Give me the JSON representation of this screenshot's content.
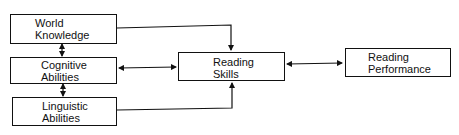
{
  "diagram": {
    "nodes": [
      {
        "id": "world_knowledge",
        "line1": "World",
        "line2": "Knowledge"
      },
      {
        "id": "cognitive_abilities",
        "line1": "Cognitive",
        "line2": "Abilities"
      },
      {
        "id": "linguistic_abilities",
        "line1": "Linguistic",
        "line2": "Abilities"
      },
      {
        "id": "reading_skills",
        "line1": "Reading",
        "line2": "Skills"
      },
      {
        "id": "reading_performance",
        "line1": "Reading",
        "line2": "Performance"
      }
    ],
    "edges": [
      {
        "from": "world_knowledge",
        "to": "cognitive_abilities",
        "type": "bidirectional"
      },
      {
        "from": "cognitive_abilities",
        "to": "linguistic_abilities",
        "type": "bidirectional"
      },
      {
        "from": "world_knowledge",
        "to": "reading_skills",
        "type": "directed"
      },
      {
        "from": "cognitive_abilities",
        "to": "reading_skills",
        "type": "bidirectional"
      },
      {
        "from": "linguistic_abilities",
        "to": "reading_skills",
        "type": "directed"
      },
      {
        "from": "reading_skills",
        "to": "reading_performance",
        "type": "bidirectional"
      }
    ],
    "colors": {
      "stroke": "#111111",
      "background": "#ffffff"
    }
  }
}
